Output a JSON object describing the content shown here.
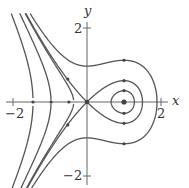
{
  "figure": {
    "axes": {
      "x_label": "x",
      "y_label": "y",
      "x_ticks": [
        {
          "value": -2,
          "label": "−2"
        },
        {
          "value": 2,
          "label": "2"
        }
      ],
      "y_ticks": [
        {
          "value": 2,
          "label": "2"
        },
        {
          "value": -2,
          "label": "−2"
        }
      ],
      "x_range": [
        -2.35,
        2.2
      ],
      "y_range": [
        -2.3,
        2.5
      ]
    },
    "system": {
      "equations": [
        "x' = y",
        "y' = x - x^2"
      ],
      "energy": "E = y^2/2 - x^2/2 + x^3/3"
    },
    "equilibria": [
      {
        "type": "saddle",
        "x": 0,
        "y": 0
      },
      {
        "type": "center",
        "x": 1,
        "y": 0
      }
    ],
    "orbits": [
      {
        "name": "inner-closed-orbit",
        "energy": -0.12
      },
      {
        "name": "homoclinic-separatrix",
        "energy": 0.0
      },
      {
        "name": "outer-orbit",
        "energy": 0.47
      },
      {
        "name": "left-orbit-1",
        "energy": -0.08
      },
      {
        "name": "left-orbit-2",
        "energy": -0.78
      },
      {
        "name": "left-orbit-3",
        "energy": -2.1
      }
    ],
    "colors": {
      "curve": "#555555",
      "axis": "#666666",
      "dot": "#444444"
    }
  }
}
